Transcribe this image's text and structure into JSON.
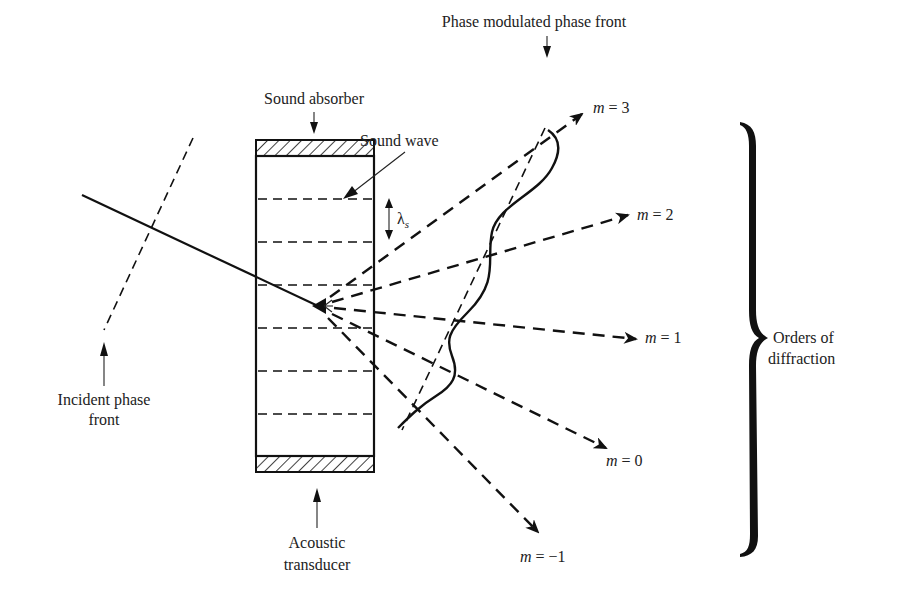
{
  "diagram": {
    "type": "acousto-optic diffraction schematic",
    "labels": {
      "sound_absorber": "Sound absorber",
      "sound_wave": "Sound wave",
      "phase_modulated_front": "Phase modulated phase front",
      "wavelength_symbol": "λ",
      "wavelength_subscript": "s",
      "incident_front_line1": "Incident phase",
      "incident_front_line2": "front",
      "transducer_line1": "Acoustic",
      "transducer_line2": "transducer",
      "orders_line1": "Orders of",
      "orders_line2": "diffraction"
    },
    "orders": [
      {
        "m_var": "m",
        "eq": " = ",
        "value": "3"
      },
      {
        "m_var": "m",
        "eq": " = ",
        "value": "2"
      },
      {
        "m_var": "m",
        "eq": " = ",
        "value": "1"
      },
      {
        "m_var": "m",
        "eq": " = ",
        "value": "0"
      },
      {
        "m_var": "m",
        "eq": " = ",
        "value": "−1"
      }
    ],
    "colors": {
      "ink": "#111111",
      "background": "#ffffff"
    }
  }
}
